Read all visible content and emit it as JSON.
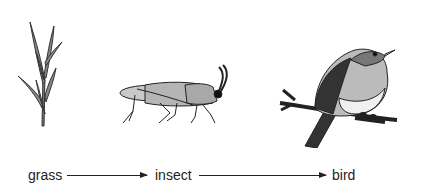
{
  "diagram": {
    "type": "food-chain",
    "organisms": [
      {
        "name": "grass",
        "icon": "grass-icon"
      },
      {
        "name": "insect",
        "icon": "grasshopper-icon"
      },
      {
        "name": "bird",
        "icon": "bird-icon"
      }
    ],
    "labels": {
      "grass": "grass",
      "insect": "insect",
      "bird": "bird"
    },
    "arrows": [
      {
        "from": "grass",
        "to": "insect"
      },
      {
        "from": "insect",
        "to": "bird"
      }
    ]
  }
}
